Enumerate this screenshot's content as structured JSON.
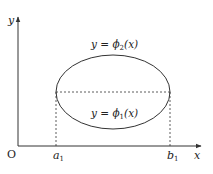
{
  "diagram": {
    "axes": {
      "x_label": "x",
      "y_label": "y",
      "origin_label": "O"
    },
    "ticks": {
      "a": {
        "base": "a",
        "sub": "1"
      },
      "b": {
        "base": "b",
        "sub": "1"
      }
    },
    "curves": {
      "upper": {
        "lhs": "y",
        "eq": " = ",
        "fn": "ϕ",
        "sub": "2",
        "arg": "(x)"
      },
      "lower": {
        "lhs": "y",
        "eq": " = ",
        "fn": "ϕ",
        "sub": "1",
        "arg": "(x)"
      }
    },
    "colors": {
      "stroke": "#333333",
      "text": "#222222"
    }
  }
}
